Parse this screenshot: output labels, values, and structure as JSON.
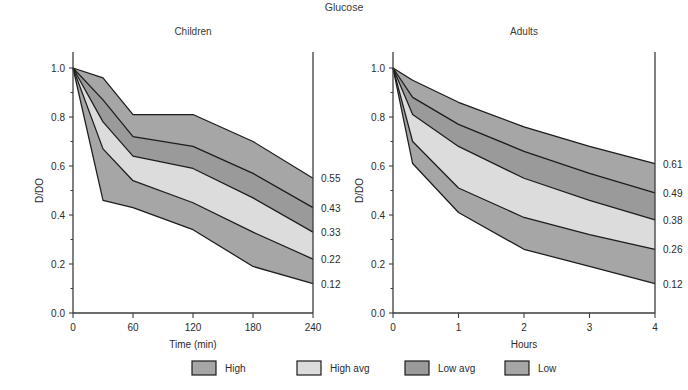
{
  "figure": {
    "title": "Glucose",
    "caption": ""
  },
  "legend": {
    "items": [
      {
        "label": "High",
        "color": "#a6a6a6"
      },
      {
        "label": "High avg",
        "color": "#dcdcdc"
      },
      {
        "label": "Low avg",
        "color": "#9a9a9a"
      },
      {
        "label": "Low",
        "color": "#a6a6a6"
      }
    ]
  },
  "chart_data": {
    "type": "area",
    "title": "Glucose",
    "ylabel": "D/DO",
    "ylim": [
      0.0,
      1.0
    ],
    "yticks": [
      "0.0",
      "0.2",
      "0.4",
      "0.6",
      "0.8",
      "1.0"
    ],
    "ytick_values": [
      0.0,
      0.2,
      0.4,
      0.6,
      0.8,
      1.0
    ],
    "grid": false,
    "legend_position": "bottom",
    "band_names": [
      "High",
      "High avg",
      "Low avg",
      "Low"
    ],
    "panels": [
      {
        "name": "children",
        "title": "Children",
        "xlabel": "Time (min)",
        "xlim": [
          0,
          240
        ],
        "xticks": [
          "0",
          "60",
          "120",
          "180",
          "240"
        ],
        "xtick_values": [
          0,
          60,
          120,
          180,
          240
        ],
        "x": [
          0,
          30,
          60,
          120,
          180,
          240
        ],
        "boundaries": [
          {
            "name": "upper",
            "end_label": "0.55",
            "values": [
              1.0,
              0.96,
              0.81,
              0.81,
              0.7,
              0.55
            ]
          },
          {
            "name": "high-mid",
            "end_label": "0.43",
            "values": [
              1.0,
              0.87,
              0.72,
              0.68,
              0.57,
              0.43
            ]
          },
          {
            "name": "mid",
            "end_label": "0.33",
            "values": [
              1.0,
              0.78,
              0.64,
              0.59,
              0.47,
              0.33
            ]
          },
          {
            "name": "low-mid",
            "end_label": "0.22",
            "values": [
              1.0,
              0.67,
              0.54,
              0.45,
              0.33,
              0.22
            ]
          },
          {
            "name": "lower",
            "end_label": "0.12",
            "values": [
              1.0,
              0.46,
              0.43,
              0.34,
              0.19,
              0.12
            ]
          }
        ],
        "end_labels": [
          "0.55",
          "0.43",
          "0.33",
          "0.22",
          "0.12"
        ]
      },
      {
        "name": "adults",
        "title": "Adults",
        "xlabel": "Hours",
        "xlim": [
          0,
          4
        ],
        "xticks": [
          "0",
          "1",
          "2",
          "3",
          "4"
        ],
        "xtick_values": [
          0,
          1,
          2,
          3,
          4
        ],
        "x": [
          0,
          0.3,
          1,
          2,
          3,
          4
        ],
        "boundaries": [
          {
            "name": "upper",
            "end_label": "0.61",
            "values": [
              1.0,
              0.95,
              0.86,
              0.76,
              0.68,
              0.61
            ]
          },
          {
            "name": "high-mid",
            "end_label": "0.49",
            "values": [
              1.0,
              0.88,
              0.77,
              0.66,
              0.57,
              0.49
            ]
          },
          {
            "name": "mid",
            "end_label": "0.38",
            "values": [
              1.0,
              0.81,
              0.68,
              0.55,
              0.46,
              0.38
            ]
          },
          {
            "name": "low-mid",
            "end_label": "0.26",
            "values": [
              1.0,
              0.7,
              0.51,
              0.39,
              0.32,
              0.26
            ]
          },
          {
            "name": "lower",
            "end_label": "0.12",
            "values": [
              1.0,
              0.61,
              0.41,
              0.26,
              0.19,
              0.12
            ]
          }
        ],
        "end_labels": [
          "0.61",
          "0.49",
          "0.38",
          "0.26",
          "0.12"
        ]
      }
    ],
    "band_colors": [
      "#a6a6a6",
      "#9a9a9a",
      "#dcdcdc",
      "#a6a6a6"
    ]
  }
}
